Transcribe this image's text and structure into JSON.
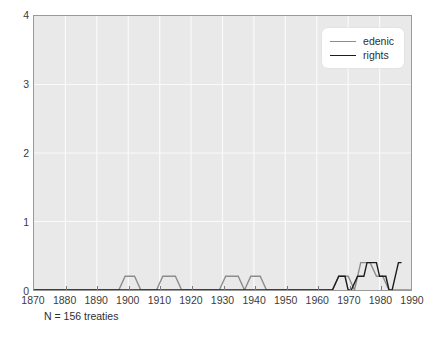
{
  "caption": "N = 156 treaties",
  "legend": {
    "position": "upper-right",
    "entries": [
      {
        "label": "edenic",
        "color": "#8c8c8c"
      },
      {
        "label": "rights",
        "color": "#1c1c1c"
      }
    ]
  },
  "style": {
    "plot_background": "#e9e9e9",
    "grid_color": "#fafafa",
    "axis_color": "#9a9a9a",
    "page_background": "#ffffff",
    "text_color": "#3c3c3c"
  },
  "chart_data": {
    "type": "line",
    "title": "",
    "xlabel": "",
    "ylabel": "",
    "xlim": [
      1870,
      1990
    ],
    "ylim": [
      0,
      4
    ],
    "xticks": [
      1870,
      1880,
      1890,
      1900,
      1910,
      1920,
      1930,
      1940,
      1950,
      1960,
      1970,
      1980,
      1990
    ],
    "yticks": [
      0,
      1,
      2,
      3,
      4
    ],
    "xtick_labels": [
      "1870",
      "1880",
      "1890",
      "1900",
      "1910",
      "1920",
      "1930",
      "1940",
      "1950",
      "1960",
      "1970",
      "1980",
      "1990"
    ],
    "ytick_labels": [
      "0",
      "1",
      "2",
      "3",
      "4"
    ],
    "grid": true,
    "legend_position": "upper right",
    "annotations": [
      "N = 156 treaties"
    ],
    "series": [
      {
        "name": "edenic",
        "color": "#8c8c8c",
        "points": [
          [
            1870,
            0
          ],
          [
            1897,
            0
          ],
          [
            1899,
            0.2
          ],
          [
            1902,
            0.2
          ],
          [
            1904,
            0
          ],
          [
            1909,
            0
          ],
          [
            1911,
            0.2
          ],
          [
            1915,
            0.2
          ],
          [
            1917,
            0
          ],
          [
            1929,
            0
          ],
          [
            1931,
            0.2
          ],
          [
            1935,
            0.2
          ],
          [
            1937,
            0
          ],
          [
            1937,
            0
          ],
          [
            1939,
            0.2
          ],
          [
            1942,
            0.2
          ],
          [
            1944,
            0
          ],
          [
            1965,
            0
          ],
          [
            1967,
            0.2
          ],
          [
            1970,
            0.2
          ],
          [
            1972,
            0
          ],
          [
            1972,
            0
          ],
          [
            1974,
            0.4
          ],
          [
            1977,
            0.4
          ],
          [
            1979,
            0.2
          ],
          [
            1981,
            0.2
          ],
          [
            1983,
            0
          ],
          [
            1990,
            0
          ]
        ]
      },
      {
        "name": "rights",
        "color": "#1c1c1c",
        "points": [
          [
            1870,
            0
          ],
          [
            1965,
            0
          ],
          [
            1967,
            0.2
          ],
          [
            1969,
            0.2
          ],
          [
            1970,
            0
          ],
          [
            1971,
            0
          ],
          [
            1973,
            0.2
          ],
          [
            1975,
            0.2
          ],
          [
            1976,
            0.4
          ],
          [
            1979,
            0.4
          ],
          [
            1980,
            0.2
          ],
          [
            1982,
            0.2
          ],
          [
            1983,
            0
          ],
          [
            1984,
            0
          ],
          [
            1986,
            0.4
          ],
          [
            1987,
            0.4
          ]
        ]
      }
    ]
  }
}
